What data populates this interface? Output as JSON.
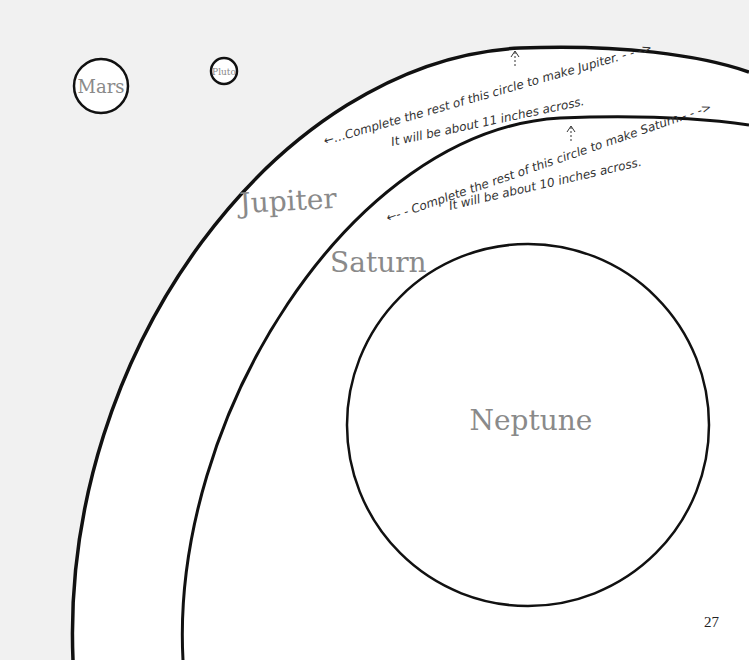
{
  "page": {
    "page_number": "27",
    "background_color": "#f1f1f1",
    "paper_color": "#ffffff",
    "line_color": "#111111",
    "label_color": "#8a8a8a"
  },
  "planets": {
    "mars": {
      "label": "Mars"
    },
    "pluto": {
      "label": "Pluto"
    },
    "jupiter": {
      "label": "Jupiter",
      "instruction_line1": "←…Complete the rest of this circle to make Jupiter. - - ->",
      "instruction_line2": "It will be about 11 inches across."
    },
    "saturn": {
      "label": "Saturn",
      "instruction_line1": "←- - Complete the rest of this circle to make Saturn.- - ->",
      "instruction_line2": "It will be about 10 inches across."
    },
    "neptune": {
      "label": "Neptune"
    }
  }
}
